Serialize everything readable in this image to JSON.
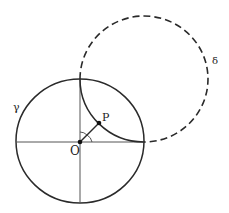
{
  "diagram": {
    "labels": {
      "origin": "O",
      "point": "P",
      "circle_gamma": "γ",
      "circle_delta": "δ"
    },
    "colors": {
      "stroke": "#2a2a2a",
      "axes": "#555555",
      "background": "#ffffff"
    },
    "elements": {
      "gamma": {
        "cx": 80,
        "cy": 141,
        "r": 63,
        "style": "solid"
      },
      "delta": {
        "cx": 145,
        "cy": 79,
        "r": 64,
        "style": "dashed"
      },
      "origin": {
        "x": 80,
        "y": 142
      },
      "point_P": {
        "x": 99,
        "y": 123
      }
    }
  }
}
